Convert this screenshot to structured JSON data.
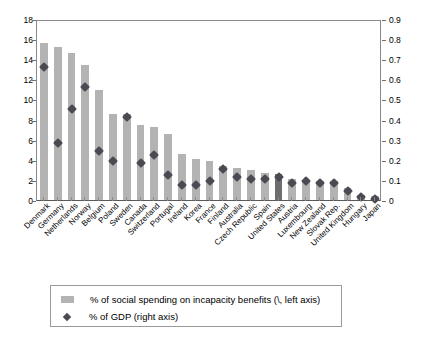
{
  "chart_data": {
    "type": "bar",
    "title": "",
    "subtitle": "",
    "xlabel": "",
    "ylabel": "",
    "grid": false,
    "legend_position": "bottom",
    "categories": [
      "Denmark",
      "Germany",
      "Netherlands",
      "Norway",
      "Belgium",
      "Poland",
      "Sweden",
      "Canada",
      "Switzerland",
      "Portugal",
      "Ireland",
      "Korea",
      "France",
      "Finland",
      "Australia",
      "Czech Republic",
      "Spain",
      "United States",
      "Austria",
      "Luxembourg",
      "New Zealand",
      "Slovak Rep.",
      "United Kingdom",
      "Hungary",
      "Japan"
    ],
    "highlight_category": "United States",
    "left_axis": {
      "label": "% of social spending on incapacity benefits",
      "min": 0,
      "max": 18,
      "ticks": [
        0,
        2,
        4,
        6,
        8,
        10,
        12,
        14,
        16,
        18
      ],
      "tick_labels": [
        "0",
        "2",
        "4",
        "6",
        "8",
        "10",
        "12",
        "14",
        "16",
        "18"
      ]
    },
    "right_axis": {
      "label": "% of GDP",
      "min": 0,
      "max": 0.9,
      "ticks": [
        0,
        0.1,
        0.2,
        0.3,
        0.4,
        0.5,
        0.6,
        0.7,
        0.8,
        0.9
      ],
      "tick_labels": [
        "0",
        "0.1",
        "0.2",
        "0.3",
        "0.4",
        "0.5",
        "0.6",
        "0.7",
        "0.8",
        "0.9"
      ]
    },
    "series": [
      {
        "name": "% of social spending on incapacity benefits (\\, left axis)",
        "type": "bar",
        "axis": "left",
        "color": "#b3b3b3",
        "highlight_color": "#6e6e6e",
        "values": [
          15.6,
          15.2,
          14.6,
          13.4,
          10.9,
          8.6,
          8.6,
          7.5,
          7.3,
          6.6,
          4.6,
          4.1,
          3.9,
          3.4,
          3.2,
          3.0,
          2.7,
          2.6,
          2.1,
          2.0,
          1.9,
          1.9,
          1.2,
          0.5,
          0.4
        ]
      },
      {
        "name": "% of GDP (right axis)",
        "type": "scatter",
        "marker": "diamond",
        "axis": "right",
        "color": "#4a4a52",
        "values": [
          0.68,
          0.3,
          0.47,
          0.58,
          0.26,
          0.21,
          0.43,
          0.2,
          0.24,
          0.14,
          0.09,
          0.09,
          0.11,
          0.17,
          0.13,
          0.12,
          0.12,
          0.13,
          0.1,
          0.11,
          0.1,
          0.1,
          0.06,
          0.03,
          0.02
        ]
      }
    ]
  },
  "legend": {
    "entries": [
      {
        "label": "% of social spending on incapacity benefits (\\, left axis)",
        "marker": "bar-swatch"
      },
      {
        "label": "% of GDP (right axis)",
        "marker": "diamond"
      }
    ]
  }
}
